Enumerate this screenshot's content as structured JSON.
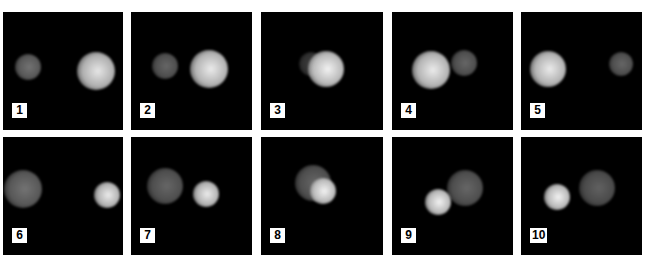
{
  "figure": {
    "panels": [
      {
        "label": "1",
        "x": 3,
        "y": 12,
        "w": 120,
        "h": 118,
        "blobs": [
          {
            "cx": 25,
            "cy": 55,
            "r": 13,
            "b": 0.45
          },
          {
            "cx": 93,
            "cy": 59,
            "r": 19,
            "b": 0.9
          }
        ]
      },
      {
        "label": "2",
        "x": 131,
        "y": 12,
        "w": 121,
        "h": 118,
        "blobs": [
          {
            "cx": 34,
            "cy": 54,
            "r": 13,
            "b": 0.4
          },
          {
            "cx": 78,
            "cy": 57,
            "r": 19,
            "b": 0.92
          }
        ]
      },
      {
        "label": "3",
        "x": 261,
        "y": 12,
        "w": 122,
        "h": 118,
        "blobs": [
          {
            "cx": 50,
            "cy": 52,
            "r": 12,
            "b": 0.25
          },
          {
            "cx": 65,
            "cy": 57,
            "r": 18,
            "b": 0.95
          }
        ]
      },
      {
        "label": "4",
        "x": 392,
        "y": 12,
        "w": 121,
        "h": 118,
        "blobs": [
          {
            "cx": 72,
            "cy": 51,
            "r": 13,
            "b": 0.4
          },
          {
            "cx": 39,
            "cy": 58,
            "r": 19,
            "b": 0.92
          }
        ]
      },
      {
        "label": "5",
        "x": 521,
        "y": 12,
        "w": 121,
        "h": 118,
        "blobs": [
          {
            "cx": 100,
            "cy": 52,
            "r": 12,
            "b": 0.4
          },
          {
            "cx": 27,
            "cy": 57,
            "r": 18,
            "b": 0.92
          }
        ]
      },
      {
        "label": "6",
        "x": 3,
        "y": 137,
        "w": 120,
        "h": 118,
        "blobs": [
          {
            "cx": 20,
            "cy": 52,
            "r": 19,
            "b": 0.45
          },
          {
            "cx": 104,
            "cy": 58,
            "r": 13,
            "b": 0.92
          }
        ]
      },
      {
        "label": "7",
        "x": 131,
        "y": 137,
        "w": 121,
        "h": 118,
        "blobs": [
          {
            "cx": 34,
            "cy": 49,
            "r": 18,
            "b": 0.4
          },
          {
            "cx": 75,
            "cy": 57,
            "r": 13,
            "b": 0.92
          }
        ]
      },
      {
        "label": "8",
        "x": 261,
        "y": 137,
        "w": 122,
        "h": 118,
        "blobs": [
          {
            "cx": 52,
            "cy": 46,
            "r": 18,
            "b": 0.4
          },
          {
            "cx": 62,
            "cy": 54,
            "r": 13,
            "b": 0.95
          }
        ]
      },
      {
        "label": "9",
        "x": 392,
        "y": 137,
        "w": 121,
        "h": 118,
        "blobs": [
          {
            "cx": 73,
            "cy": 51,
            "r": 18,
            "b": 0.4
          },
          {
            "cx": 46,
            "cy": 65,
            "r": 13,
            "b": 0.95
          }
        ]
      },
      {
        "label": "10",
        "x": 521,
        "y": 137,
        "w": 121,
        "h": 118,
        "blobs": [
          {
            "cx": 76,
            "cy": 51,
            "r": 18,
            "b": 0.38
          },
          {
            "cx": 36,
            "cy": 60,
            "r": 13,
            "b": 0.95
          }
        ]
      }
    ],
    "label_offset": {
      "x": 9,
      "y": 91
    }
  }
}
